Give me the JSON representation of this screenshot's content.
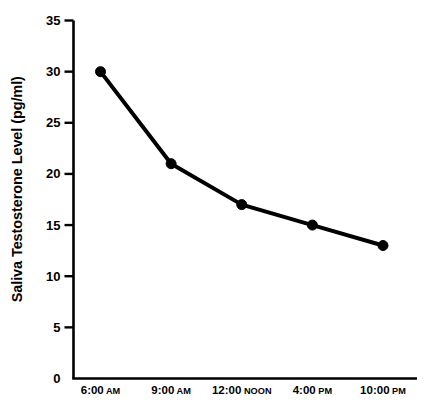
{
  "chart_data": {
    "type": "line",
    "title": "",
    "xlabel": "",
    "ylabel": "Saliva Testosterone Level (pg/ml)",
    "categories": [
      "6:00 AM",
      "9:00 AM",
      "12:00 NOON",
      "4:00 PM",
      "10:00 PM"
    ],
    "category_parts": [
      {
        "time": "6:00",
        "suffix": "AM"
      },
      {
        "time": "9:00",
        "suffix": "AM"
      },
      {
        "time": "12:00",
        "suffix": "NOON"
      },
      {
        "time": "4:00",
        "suffix": "PM"
      },
      {
        "time": "10:00",
        "suffix": "PM"
      }
    ],
    "values": [
      30,
      21,
      17,
      15,
      13
    ],
    "ylim": [
      0,
      35
    ],
    "ytick_labels": [
      "0",
      "5",
      "10",
      "15",
      "20",
      "25",
      "30",
      "35"
    ],
    "ytick_values": [
      0,
      5,
      10,
      15,
      20,
      25,
      30,
      35
    ],
    "grid": false,
    "legend": "none",
    "series_color": "#000000",
    "axis_color": "#000000",
    "background_color": "#ffffff",
    "marker": "filled-circle"
  }
}
